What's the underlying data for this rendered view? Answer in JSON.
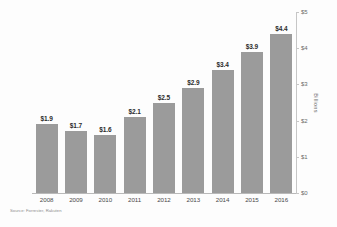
{
  "chart_data": {
    "type": "bar",
    "title": "",
    "subtitle": "",
    "xlabel": "",
    "ylabel": "Billions",
    "categories": [
      "2008",
      "2009",
      "2010",
      "2011",
      "2012",
      "2013",
      "2014",
      "2015",
      "2016"
    ],
    "values": [
      1.9,
      1.7,
      1.6,
      2.1,
      2.5,
      2.9,
      3.4,
      3.9,
      4.4
    ],
    "data_labels": [
      "$1.9",
      "$1.7",
      "$1.6",
      "$2.1",
      "$2.5",
      "$2.9",
      "$3.4",
      "$3.9",
      "$4.4"
    ],
    "ylim": [
      0,
      5
    ],
    "ytick_values": [
      0,
      1,
      2,
      3,
      4,
      5
    ],
    "ytick_labels": [
      "$0",
      "$1",
      "$2",
      "$3",
      "$4",
      "$5"
    ],
    "yaxis_position": "right",
    "grid": false,
    "legend": null,
    "bar_color": "#9b9b9b",
    "axis_color": "#c6c6c6",
    "label_color": "#2b2b2b"
  },
  "source_note": "Source: Forrester, Rakuten"
}
